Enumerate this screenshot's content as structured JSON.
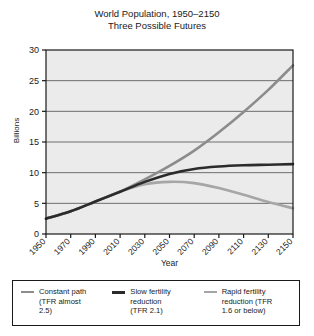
{
  "chart_data": {
    "type": "line",
    "title": "World Population, 1950–2150",
    "subtitle": "Three Possible Futures",
    "xlabel": "Year",
    "ylabel": "Billions",
    "xlim": [
      1950,
      2150
    ],
    "ylim": [
      0,
      30
    ],
    "ytick_step": 5,
    "xtick_step": 20,
    "grid": "horizontal",
    "legend_position": "below",
    "xticks": [
      "1950",
      "1970",
      "1990",
      "2010",
      "2030",
      "2050",
      "2070",
      "2090",
      "2110",
      "2130",
      "2150"
    ],
    "yticks": [
      "0",
      "5",
      "10",
      "15",
      "20",
      "25",
      "30"
    ],
    "x": [
      1950,
      1970,
      1990,
      2010,
      2030,
      2050,
      2070,
      2090,
      2110,
      2130,
      2150
    ],
    "series": [
      {
        "name": "Constant path (TFR almost 2.5)",
        "color": "#8c8c8c",
        "width": 2.6,
        "values": [
          2.5,
          3.7,
          5.3,
          6.9,
          8.9,
          11.1,
          13.6,
          16.6,
          19.9,
          23.5,
          27.5
        ]
      },
      {
        "name": "Slow fertility reduction (TFR 2.1)",
        "color": "#2b2b2b",
        "width": 2.6,
        "values": [
          2.5,
          3.7,
          5.3,
          6.9,
          8.5,
          9.8,
          10.6,
          11.0,
          11.2,
          11.3,
          11.4
        ]
      },
      {
        "name": "Rapid fertility reduction (TFR 1.6 or below)",
        "color": "#a6a6a6",
        "width": 2.6,
        "values": [
          2.5,
          3.7,
          5.3,
          6.9,
          8.1,
          8.5,
          8.3,
          7.5,
          6.4,
          5.2,
          4.2
        ]
      }
    ]
  },
  "legend": {
    "entries": [
      {
        "label": "Constant path\n(TFR almost\n2.5)",
        "swatch": "thin",
        "color": "#8c8c8c"
      },
      {
        "label": "Slow fertility\nreduction\n(TFR 2.1)",
        "swatch": "thick",
        "color": "#2b2b2b"
      },
      {
        "label": "Rapid fertility\nreduction (TFR\n1.6 or below)",
        "swatch": "thin",
        "color": "#a6a6a6"
      }
    ]
  },
  "style": {
    "plot_background": "#ebebeb",
    "axis_color": "#1a1a1a",
    "grid_color": "#6e6e6e"
  }
}
